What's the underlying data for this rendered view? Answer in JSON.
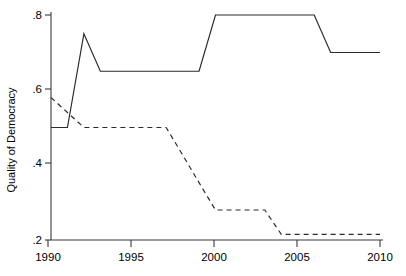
{
  "chart_data": {
    "type": "line",
    "title": "",
    "subtitle": "",
    "xlabel": "",
    "ylabel": "Quality of Democracy",
    "xlim": [
      1990,
      2010
    ],
    "ylim": [
      0.2,
      0.8
    ],
    "xticks": [
      1990,
      1995,
      2000,
      2005,
      2010
    ],
    "xtick_labels": [
      "1990",
      "1995",
      "2000",
      "2005",
      "2010"
    ],
    "yticks": [
      0.2,
      0.4,
      0.6,
      0.8
    ],
    "ytick_labels": [
      ".2",
      ".4",
      ".6",
      ".8"
    ],
    "grid": false,
    "legend": null,
    "legend_position": "none",
    "annotations": [],
    "series": [
      {
        "name": "solid-series",
        "style": "solid",
        "color": "#2b2b2b",
        "x": [
          1990,
          1991,
          1992,
          1993,
          1994,
          1995,
          1996,
          1997,
          1998,
          1999,
          2000,
          2001,
          2002,
          2003,
          2004,
          2005,
          2006,
          2007,
          2008,
          2009,
          2010
        ],
        "values": [
          0.5,
          0.5,
          0.75,
          0.65,
          0.65,
          0.65,
          0.65,
          0.65,
          0.65,
          0.65,
          0.8,
          0.8,
          0.8,
          0.8,
          0.8,
          0.8,
          0.8,
          0.7,
          0.7,
          0.7,
          0.7
        ]
      },
      {
        "name": "dashed-series",
        "style": "dashed",
        "color": "#2b2b2b",
        "x": [
          1990,
          1991,
          1992,
          1993,
          1994,
          1995,
          1996,
          1997,
          1998,
          1999,
          2000,
          2001,
          2002,
          2003,
          2004,
          2005,
          2006,
          2007,
          2008,
          2009,
          2010
        ],
        "values": [
          0.58,
          0.54,
          0.5,
          0.5,
          0.5,
          0.5,
          0.5,
          0.5,
          0.427,
          0.353,
          0.28,
          0.28,
          0.28,
          0.28,
          0.215,
          0.215,
          0.215,
          0.215,
          0.215,
          0.215,
          0.215
        ]
      }
    ]
  },
  "axis": {
    "y_title": "Quality of Democracy",
    "x_tick_1": "1990",
    "x_tick_2": "1995",
    "x_tick_3": "2000",
    "x_tick_4": "2005",
    "x_tick_5": "2010",
    "y_tick_1": ".2",
    "y_tick_2": ".4",
    "y_tick_3": ".6",
    "y_tick_4": ".8"
  }
}
